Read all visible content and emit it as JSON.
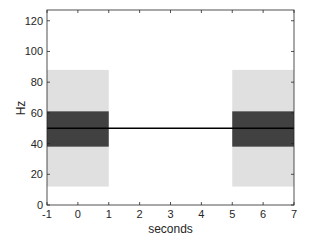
{
  "chart_data": {
    "type": "area",
    "title": "",
    "xlabel": "seconds",
    "ylabel": "Hz",
    "xlim": [
      -1,
      7
    ],
    "ylim": [
      0,
      127
    ],
    "xticks": [
      -1,
      0,
      1,
      2,
      3,
      4,
      5,
      6,
      7
    ],
    "yticks": [
      0,
      20,
      40,
      60,
      80,
      100,
      120
    ],
    "grid": false,
    "legend": null,
    "shaded_regions": [
      {
        "name": "outer-band-left",
        "x": [
          -1,
          1
        ],
        "y": [
          12,
          88
        ],
        "color": "#e0e0e0"
      },
      {
        "name": "outer-band-right",
        "x": [
          5,
          7
        ],
        "y": [
          12,
          88
        ],
        "color": "#e0e0e0"
      },
      {
        "name": "inner-band-left",
        "x": [
          -1,
          1
        ],
        "y": [
          38,
          61
        ],
        "color": "#414141"
      },
      {
        "name": "inner-band-right",
        "x": [
          5,
          7
        ],
        "y": [
          38,
          61
        ],
        "color": "#414141"
      }
    ],
    "series": [
      {
        "name": "center-frequency",
        "x": [
          -1,
          7
        ],
        "y": [
          50,
          50
        ],
        "color": "#000000"
      }
    ]
  },
  "axes": {
    "xlabel": "seconds",
    "ylabel": "Hz",
    "xtick_labels": [
      "-1",
      "0",
      "1",
      "2",
      "3",
      "4",
      "5",
      "6",
      "7"
    ],
    "ytick_labels": [
      "0",
      "20",
      "40",
      "60",
      "80",
      "100",
      "120"
    ]
  }
}
